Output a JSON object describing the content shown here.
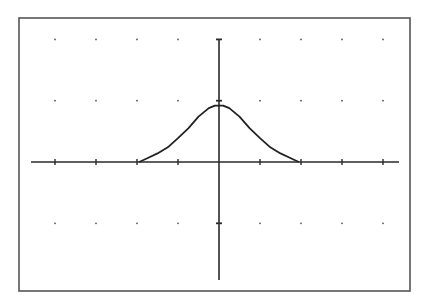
{
  "chart_data": {
    "type": "line",
    "title": "",
    "xlabel": "",
    "ylabel": "",
    "xlim": [
      -4.5,
      4.5
    ],
    "ylim": [
      -2,
      2
    ],
    "x_ticks": [
      -4,
      -3,
      -2,
      -1,
      0,
      1,
      2,
      3,
      4
    ],
    "y_ticks": [
      -1,
      0,
      1,
      2
    ],
    "grid": "dots",
    "legend": null,
    "series": [
      {
        "name": "bump",
        "x": [
          -1.95,
          -1.75,
          -1.5,
          -1.25,
          -1.0,
          -0.75,
          -0.5,
          -0.25,
          -0.1,
          0,
          0.1,
          0.25,
          0.5,
          0.75,
          1.0,
          1.25,
          1.5,
          1.75,
          1.95
        ],
        "y": [
          0.0,
          0.06,
          0.14,
          0.24,
          0.39,
          0.55,
          0.74,
          0.88,
          0.92,
          0.92,
          0.92,
          0.88,
          0.74,
          0.55,
          0.39,
          0.24,
          0.14,
          0.06,
          0.0
        ],
        "color": "#222222"
      }
    ]
  },
  "layout": {
    "frame": {
      "x1": 19,
      "y1": 18,
      "x2": 410,
      "y2": 291
    },
    "origin_px": {
      "x": 219,
      "y": 162
    },
    "unit_px": {
      "x": 41,
      "y": 61.3
    },
    "x_axis_px": [
      31,
      399
    ],
    "y_axis_px": [
      39,
      280
    ],
    "colors": {
      "axis": "#2a2a2a",
      "frame": "#555555",
      "curve": "#222222",
      "grid": "#555555"
    }
  }
}
